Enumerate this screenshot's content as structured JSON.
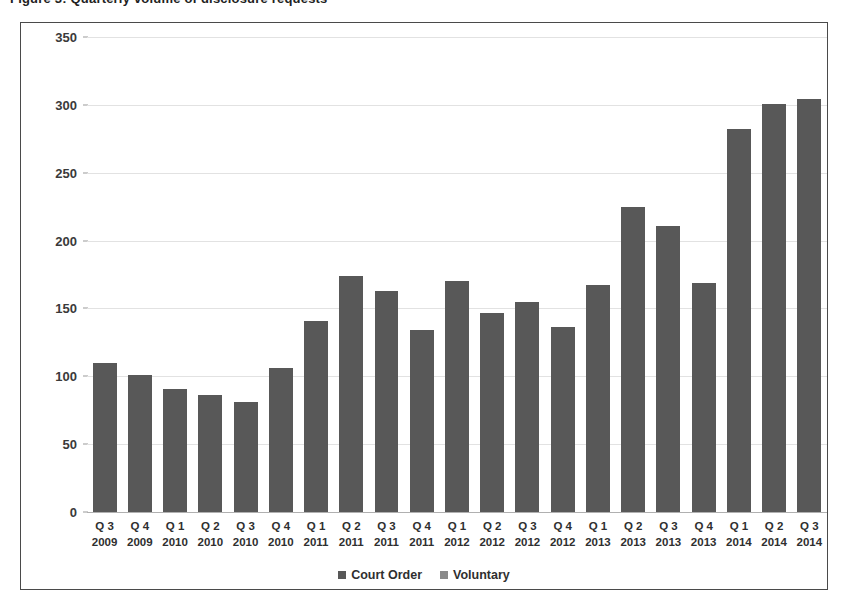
{
  "top_sliver": {
    "text": "Figure 3: Quarterly volume of disclosure requests"
  },
  "chart_data": {
    "type": "bar",
    "title": "",
    "subtitle": "",
    "xlabel": "",
    "ylabel": "",
    "ylim": [
      0,
      350
    ],
    "yticks": [
      0,
      50,
      100,
      150,
      200,
      250,
      300,
      350
    ],
    "grid": true,
    "legend_position": "bottom",
    "categories": [
      "Q 3 2009",
      "Q 4 2009",
      "Q 1 2010",
      "Q 2 2010",
      "Q 3 2010",
      "Q 4 2010",
      "Q 1 2011",
      "Q 2 2011",
      "Q 3 2011",
      "Q 4 2011",
      "Q 1 2012",
      "Q 2 2012",
      "Q 3 2012",
      "Q 4 2012",
      "Q 1 2013",
      "Q 2 2013",
      "Q 3 2013",
      "Q 4 2013",
      "Q 1 2014",
      "Q 2 2014",
      "Q 3 2014"
    ],
    "category_parts": [
      {
        "quarter": "Q 3",
        "year": "2009"
      },
      {
        "quarter": "Q 4",
        "year": "2009"
      },
      {
        "quarter": "Q 1",
        "year": "2010"
      },
      {
        "quarter": "Q 2",
        "year": "2010"
      },
      {
        "quarter": "Q 3",
        "year": "2010"
      },
      {
        "quarter": "Q 4",
        "year": "2010"
      },
      {
        "quarter": "Q 1",
        "year": "2011"
      },
      {
        "quarter": "Q 2",
        "year": "2011"
      },
      {
        "quarter": "Q 3",
        "year": "2011"
      },
      {
        "quarter": "Q 4",
        "year": "2011"
      },
      {
        "quarter": "Q 1",
        "year": "2012"
      },
      {
        "quarter": "Q 2",
        "year": "2012"
      },
      {
        "quarter": "Q 3",
        "year": "2012"
      },
      {
        "quarter": "Q 4",
        "year": "2012"
      },
      {
        "quarter": "Q 1",
        "year": "2013"
      },
      {
        "quarter": "Q 2",
        "year": "2013"
      },
      {
        "quarter": "Q 3",
        "year": "2013"
      },
      {
        "quarter": "Q 4",
        "year": "2013"
      },
      {
        "quarter": "Q 1",
        "year": "2014"
      },
      {
        "quarter": "Q 2",
        "year": "2014"
      },
      {
        "quarter": "Q 3",
        "year": "2014"
      }
    ],
    "series": [
      {
        "name": "Court Order",
        "color": "#585858",
        "values": [
          110,
          101,
          91,
          86,
          81,
          106,
          141,
          174,
          163,
          134,
          170,
          147,
          155,
          136,
          167,
          225,
          211,
          169,
          282,
          301,
          304
        ]
      },
      {
        "name": "Voluntary",
        "color": "#585858",
        "values": [
          0,
          0,
          0,
          0,
          0,
          0,
          0,
          0,
          0,
          0,
          0,
          0,
          0,
          0,
          0,
          0,
          0,
          0,
          0,
          0,
          0
        ]
      }
    ]
  },
  "legend": {
    "entries": [
      {
        "label": "Court Order",
        "color": "#585858"
      },
      {
        "label": "Voluntary",
        "color": "#8a8a8a"
      }
    ]
  },
  "colors": {
    "bar": "#585858",
    "gridline": "#e2e2e2",
    "axis": "#b0b0b0",
    "frame_border": "#4a4a4a",
    "text": "#2f2f2f",
    "background": "#ffffff"
  }
}
